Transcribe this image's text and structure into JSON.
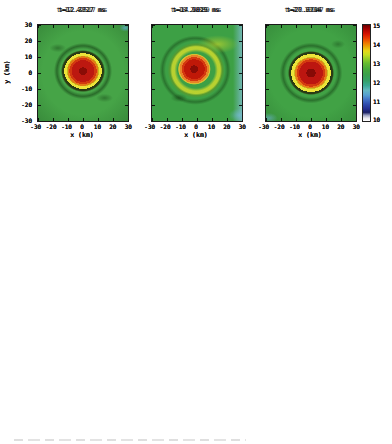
{
  "figure": {
    "axes": {
      "xlabel": "x (km)",
      "ylabel": "y (km)",
      "xticks": [
        "-30",
        "-20",
        "-10",
        "0",
        "10",
        "20",
        "30"
      ],
      "yticks": [
        "30",
        "20",
        "10",
        "0",
        "-10",
        "-20",
        "-30"
      ]
    },
    "colorbar": {
      "ticks": [
        "15",
        "14",
        "13",
        "12",
        "11",
        "10"
      ],
      "range_min": 10,
      "range_max": 15,
      "top_color": "#6b0000",
      "bottom_color": "#ffffff"
    },
    "rows": [
      {
        "panels": [
          {
            "title": "t=12.42517 ms"
          },
          {
            "title": "t=18.29889 ms"
          },
          {
            "title": "t=27.10947 ms"
          }
        ]
      },
      {
        "panels": [
          {
            "title": "t=12.3817 ms"
          },
          {
            "title": "t=17.9829 ms"
          },
          {
            "title": "t=27.7114 ms"
          }
        ]
      },
      {
        "panels": [
          {
            "title": "t=12.7727 ms"
          },
          {
            "title": "t=14.9015 ms"
          },
          {
            "title": "t=20.6796 ms"
          }
        ]
      }
    ],
    "colors": {
      "core_red": "#b81410",
      "ring_yellow": "#e4dc2e",
      "disk_green": "#46a647",
      "halo_cyan": "#a2d8d6",
      "background_navy": "#1f2a74",
      "row3_background_green": "#42a146"
    }
  },
  "chart_data": [
    {
      "type": "heatmap",
      "panel": "row1-col1",
      "title": "t=12.42517 ms",
      "xlabel": "x (km)",
      "ylabel": "y (km)",
      "xlim": [
        -30,
        30
      ],
      "ylim": [
        -30,
        30
      ],
      "colorbar_ticks": [
        15,
        14,
        13,
        12,
        11,
        10
      ],
      "radial_profile_r_km": [
        0,
        5,
        10,
        13,
        16,
        22,
        30,
        42
      ],
      "radial_profile_value": [
        15.0,
        14.6,
        14.0,
        13.4,
        12.7,
        12.3,
        11.2,
        10.3
      ]
    },
    {
      "type": "heatmap",
      "panel": "row1-col2",
      "title": "t=18.29889 ms",
      "xlabel": "x (km)",
      "ylabel": "y (km)",
      "xlim": [
        -30,
        30
      ],
      "ylim": [
        -30,
        30
      ],
      "colorbar_ticks": [
        15,
        14,
        13,
        12,
        11,
        10
      ],
      "radial_profile_r_km": [
        0,
        5,
        10,
        13,
        16,
        24,
        34,
        42
      ],
      "radial_profile_value": [
        15.0,
        14.7,
        14.0,
        13.4,
        12.7,
        12.3,
        11.4,
        10.4
      ]
    },
    {
      "type": "heatmap",
      "panel": "row1-col3",
      "title": "t=27.10947 ms",
      "xlabel": "x (km)",
      "ylabel": "y (km)",
      "xlim": [
        -30,
        30
      ],
      "ylim": [
        -30,
        30
      ],
      "colorbar_ticks": [
        15,
        14,
        13,
        12,
        11,
        10
      ],
      "radial_profile_r_km": [
        0,
        5,
        10,
        13,
        16,
        24,
        34,
        42
      ],
      "radial_profile_value": [
        15.0,
        14.7,
        14.1,
        13.5,
        12.7,
        12.3,
        11.6,
        10.4
      ]
    },
    {
      "type": "heatmap",
      "panel": "row2-col1",
      "title": "t=12.3817 ms",
      "xlabel": "x (km)",
      "ylabel": "y (km)",
      "xlim": [
        -30,
        30
      ],
      "ylim": [
        -30,
        30
      ],
      "colorbar_ticks": [
        15,
        14,
        13,
        12,
        11,
        10
      ],
      "radial_profile_r_km": [
        0,
        6,
        12,
        15,
        18,
        25,
        34,
        42
      ],
      "radial_profile_value": [
        15.0,
        14.7,
        14.0,
        13.4,
        12.7,
        12.3,
        11.3,
        10.4
      ]
    },
    {
      "type": "heatmap",
      "panel": "row2-col2",
      "title": "t=17.9829 ms",
      "xlabel": "x (km)",
      "ylabel": "y (km)",
      "xlim": [
        -30,
        30
      ],
      "ylim": [
        -30,
        30
      ],
      "colorbar_ticks": [
        15,
        14,
        13,
        12,
        11,
        10
      ],
      "radial_profile_r_km": [
        0,
        6,
        12,
        15,
        18,
        25,
        34,
        42
      ],
      "radial_profile_value": [
        15.0,
        14.7,
        14.0,
        13.5,
        12.7,
        12.3,
        11.5,
        10.4
      ]
    },
    {
      "type": "heatmap",
      "panel": "row2-col3",
      "title": "t=27.7114 ms",
      "xlabel": "x (km)",
      "ylabel": "y (km)",
      "xlim": [
        -30,
        30
      ],
      "ylim": [
        -30,
        30
      ],
      "colorbar_ticks": [
        15,
        14,
        13,
        12,
        11,
        10
      ],
      "radial_profile_r_km": [
        0,
        6,
        12,
        15,
        19,
        26,
        35,
        42
      ],
      "radial_profile_value": [
        15.0,
        14.7,
        14.1,
        13.5,
        12.8,
        12.3,
        11.6,
        10.5
      ]
    },
    {
      "type": "heatmap",
      "panel": "row3-col1",
      "title": "t=12.7727 ms",
      "xlabel": "x (km)",
      "ylabel": "y (km)",
      "xlim": [
        -30,
        30
      ],
      "ylim": [
        -30,
        30
      ],
      "colorbar_ticks": [
        15,
        14,
        13,
        12,
        11,
        10
      ],
      "radial_profile_r_km": [
        0,
        6,
        12,
        15,
        19,
        27,
        42
      ],
      "radial_profile_value": [
        15.0,
        14.7,
        14.0,
        13.5,
        12.8,
        12.4,
        12.1
      ]
    },
    {
      "type": "heatmap",
      "panel": "row3-col2",
      "title": "t=14.9015 ms",
      "xlabel": "x (km)",
      "ylabel": "y (km)",
      "xlim": [
        -30,
        30
      ],
      "ylim": [
        -30,
        30
      ],
      "colorbar_ticks": [
        15,
        14,
        13,
        12,
        11,
        10
      ],
      "radial_profile_r_km": [
        0,
        6,
        12,
        15,
        20,
        28,
        42
      ],
      "radial_profile_value": [
        15.0,
        14.6,
        13.9,
        13.5,
        12.9,
        12.4,
        12.1
      ]
    },
    {
      "type": "heatmap",
      "panel": "row3-col3",
      "title": "t=20.6796 ms",
      "xlabel": "x (km)",
      "ylabel": "y (km)",
      "xlim": [
        -30,
        30
      ],
      "ylim": [
        -30,
        30
      ],
      "colorbar_ticks": [
        15,
        14,
        13,
        12,
        11,
        10
      ],
      "radial_profile_r_km": [
        0,
        6,
        13,
        16,
        21,
        30,
        42
      ],
      "radial_profile_value": [
        15.0,
        14.7,
        14.1,
        13.5,
        12.9,
        12.4,
        12.2
      ]
    }
  ]
}
